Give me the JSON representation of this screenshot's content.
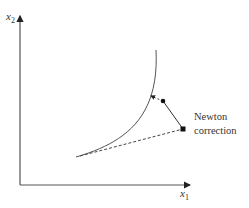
{
  "axes": {
    "x_label": "x",
    "x_sub": "1",
    "y_label": "x",
    "y_sub": "2"
  },
  "annotation": {
    "line1": "Newton",
    "line2": "correction"
  },
  "colors": {
    "line": "#444444",
    "text": "#333333"
  }
}
